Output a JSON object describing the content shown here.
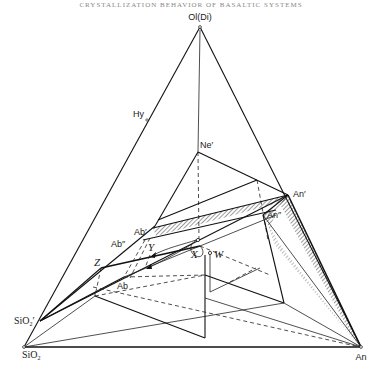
{
  "header": {
    "running_title": "CRYSTALLIZATION BEHAVIOR OF BASALTIC SYSTEMS"
  },
  "diagram": {
    "type": "ternary-tetrahedral-projection",
    "vertices": {
      "apex": {
        "label": "Ol(Di)",
        "x": 200,
        "y": 27
      },
      "bottom_left": {
        "label": "SiO2",
        "label_main": "SiO",
        "label_sub": "2",
        "x": 24,
        "y": 347
      },
      "bottom_right": {
        "label": "An",
        "x": 361,
        "y": 347
      }
    },
    "points": [
      {
        "id": "hy",
        "label_main": "Hy",
        "label_sub": "",
        "x": 147,
        "y": 120
      },
      {
        "id": "ne-prime",
        "label": "Ne′",
        "x": 198,
        "y": 152
      },
      {
        "id": "an-prime",
        "label": "An′",
        "x": 288,
        "y": 195
      },
      {
        "id": "an-double-prime",
        "label": "An″",
        "x": 263,
        "y": 215
      },
      {
        "id": "ab-prime",
        "label": "Ab′",
        "x": 155,
        "y": 226
      },
      {
        "id": "ab-double-prime",
        "label": "Ab″",
        "x": 143,
        "y": 240
      },
      {
        "id": "z",
        "label": "Z",
        "x": 101,
        "y": 268
      },
      {
        "id": "ab",
        "label": "Ab",
        "x": 124,
        "y": 277
      },
      {
        "id": "x",
        "label": "X",
        "x": 196,
        "y": 249
      },
      {
        "id": "w",
        "label": "W",
        "x": 210,
        "y": 253
      },
      {
        "id": "y",
        "label": "Y",
        "x": 152,
        "y": 252
      },
      {
        "id": "sio2-prime",
        "label_main": "SiO",
        "label_sub": "2",
        "label_suffix": "′",
        "x": 40,
        "y": 321
      }
    ],
    "labels": {
      "apex": "Ol(Di)",
      "hy": "Hy",
      "ne_prime": "Ne′",
      "an_prime": "An′",
      "an_double_prime": "An″",
      "ab_prime": "Ab′",
      "ab_double_prime": "Ab″",
      "z": "Z",
      "ab": "Ab",
      "x": "X",
      "w": "W",
      "y": "Y",
      "sio2_prime_main": "SiO",
      "sio2_prime_sub": "2",
      "sio2_prime_suffix": "′",
      "sio2_main": "SiO",
      "sio2_sub": "2",
      "an": "An"
    }
  }
}
